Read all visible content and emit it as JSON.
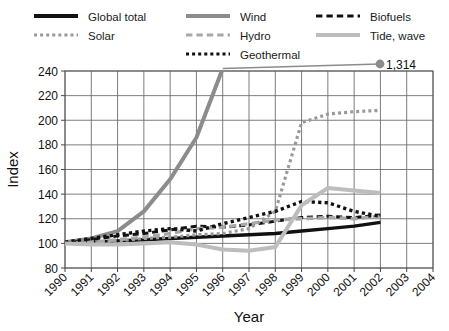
{
  "chart_data": {
    "type": "line",
    "title": "",
    "xlabel": "Year",
    "ylabel": "Index",
    "ylim": [
      80,
      240
    ],
    "xlim": [
      1990,
      2004
    ],
    "yticks": [
      80,
      100,
      120,
      140,
      160,
      180,
      200,
      220,
      240
    ],
    "grid": true,
    "legend_position": "top",
    "x": [
      1990,
      1991,
      1992,
      1993,
      1994,
      1995,
      1996,
      1997,
      1998,
      1999,
      2000,
      2001,
      2002,
      2003,
      2004
    ],
    "xticklabels": [
      "1990",
      "1991",
      "1992",
      "1993",
      "1994",
      "1995",
      "1996",
      "1997",
      "1998",
      "1999",
      "2000",
      "2001",
      "2002",
      "2003",
      "2004"
    ],
    "annotations": [
      {
        "label": "1,314",
        "series": "Wind",
        "x": 2002,
        "note": "Wind index endpoint marker above plot area"
      }
    ],
    "series": [
      {
        "name": "Global total",
        "color": "#111111",
        "style": "solid",
        "width": 3.4,
        "values": [
          100,
          101,
          102,
          103,
          104,
          105,
          106,
          107,
          108,
          110,
          112,
          114,
          117,
          null,
          null
        ]
      },
      {
        "name": "Wind",
        "color": "#8c8c8c",
        "style": "solid",
        "width": 4.0,
        "values": [
          101,
          104,
          110,
          126,
          152,
          186,
          242,
          null,
          null,
          null,
          null,
          null,
          null,
          null,
          null
        ]
      },
      {
        "name": "Biofuels",
        "color": "#111111",
        "style": "dashed",
        "width": 3.0,
        "values": [
          100,
          103,
          106,
          108,
          111,
          114,
          113,
          115,
          118,
          121,
          122,
          121,
          123,
          null,
          null
        ]
      },
      {
        "name": "Solar",
        "color": "#9a9a9a",
        "style": "dotted",
        "width": 3.2,
        "values": [
          100,
          101,
          102,
          104,
          105,
          107,
          108,
          112,
          126,
          198,
          205,
          207,
          208,
          null,
          null
        ]
      },
      {
        "name": "Hydro",
        "color": "#a8a8a8",
        "style": "dashed",
        "width": 3.4,
        "values": [
          100,
          101,
          103,
          105,
          108,
          112,
          113,
          116,
          119,
          120,
          121,
          120,
          122,
          null,
          null
        ]
      },
      {
        "name": "Geothermal",
        "color": "#111111",
        "style": "dotted",
        "width": 3.4,
        "values": [
          101,
          104,
          107,
          110,
          112,
          110,
          116,
          121,
          126,
          134,
          133,
          126,
          122,
          null,
          null
        ]
      },
      {
        "name": "Tide, wave",
        "color": "#bdbdbd",
        "style": "solid",
        "width": 4.0,
        "values": [
          100,
          99,
          99,
          100,
          101,
          99,
          95,
          94,
          97,
          131,
          145,
          143,
          141,
          null,
          null
        ]
      }
    ]
  },
  "legend": {
    "items": [
      {
        "label": "Global total",
        "key": "global-total",
        "swatch": "solid",
        "color": "#111111",
        "col": 0,
        "row": 0
      },
      {
        "label": "Wind",
        "key": "wind",
        "swatch": "solid",
        "color": "#8c8c8c",
        "col": 1,
        "row": 0
      },
      {
        "label": "Biofuels",
        "key": "biofuels",
        "swatch": "dashed",
        "color": "#111111",
        "col": 2,
        "row": 0
      },
      {
        "label": "Solar",
        "key": "solar",
        "swatch": "dotted",
        "color": "#9a9a9a",
        "col": 0,
        "row": 1
      },
      {
        "label": "Hydro",
        "key": "hydro",
        "swatch": "dashed",
        "color": "#a8a8a8",
        "col": 1,
        "row": 1
      },
      {
        "label": "Tide, wave",
        "key": "tide-wave",
        "swatch": "solid",
        "color": "#bdbdbd",
        "col": 2,
        "row": 1
      },
      {
        "label": "Geothermal",
        "key": "geothermal",
        "swatch": "dotted",
        "color": "#111111",
        "col": 1,
        "row": 2
      }
    ]
  },
  "axes": {
    "y_title": "Index",
    "x_title": "Year"
  },
  "marker": {
    "value_label": "1,314",
    "color": "#8c8c8c"
  }
}
